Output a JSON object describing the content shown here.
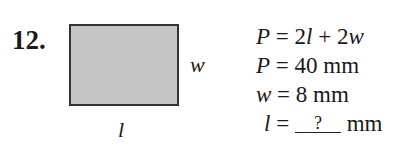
{
  "problem": {
    "number": "12.",
    "figure": {
      "shape": "rectangle",
      "fill_color": "#c6c6c6",
      "border_color": "#333333",
      "width_label": "w",
      "length_label": "l"
    },
    "equations": [
      {
        "lhs": "P",
        "rhs": "2l + 2w",
        "rhs_parts": [
          "2",
          "l",
          " + 2",
          "w"
        ]
      },
      {
        "lhs": "P",
        "rhs": "40 mm",
        "value": "40",
        "unit": "mm"
      },
      {
        "lhs": "w",
        "rhs": "8 mm",
        "value": "8",
        "unit": "mm"
      },
      {
        "lhs": "l",
        "rhs": "? mm",
        "blank": "?",
        "unit": "mm"
      }
    ],
    "equals": "="
  }
}
